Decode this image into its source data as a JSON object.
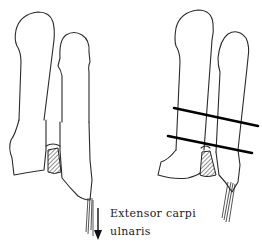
{
  "figure": {
    "panels": [
      {
        "id": "left",
        "description": "Fourth and fifth metacarpals with shaded cartilage block at base; arrow indicating pull of tendon"
      },
      {
        "id": "right",
        "description": "Same metacarpals with two transverse osteotomy lines"
      }
    ],
    "labels": {
      "tendon_line1": "Extensor  carpi",
      "tendon_line2": "ulnaris"
    },
    "colors": {
      "line": "#2a2a2a",
      "cut_line": "#000000",
      "background": "#ffffff"
    }
  }
}
